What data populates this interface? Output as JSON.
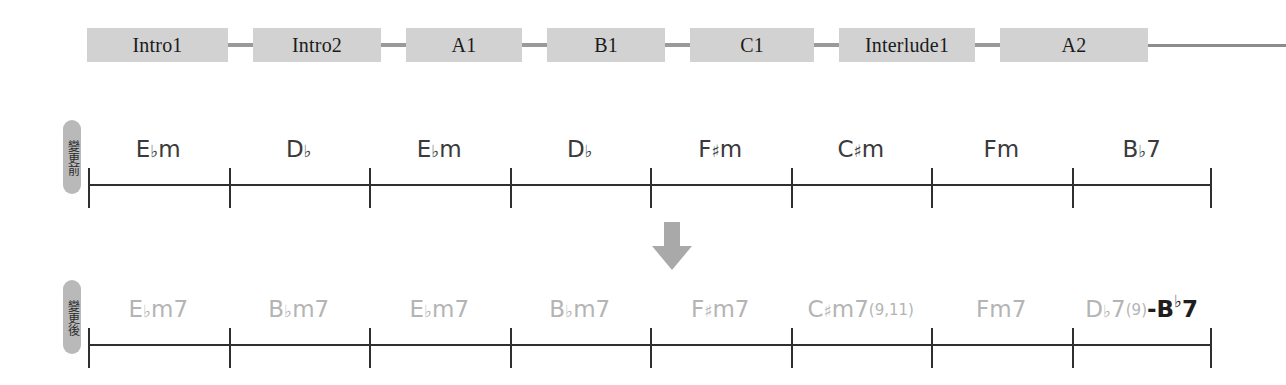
{
  "form_row": {
    "name": "song-form-timeline",
    "blocks": [
      {
        "label": "Intro1",
        "width": 141
      },
      {
        "label": "Intro2",
        "width": 128
      },
      {
        "label": "A1",
        "width": 116
      },
      {
        "label": "B1",
        "width": 118
      },
      {
        "label": "C1",
        "width": 124
      },
      {
        "label": "Interlude1",
        "width": 136
      },
      {
        "label": "A2",
        "width": 148
      }
    ],
    "connector_icon": "dash-connector-icon",
    "tail_icon": "timeline-continuation-line"
  },
  "staves": [
    {
      "id": "before",
      "tag_label": "變更前",
      "tag_meaning": "before-change",
      "cells": 8,
      "chords": [
        {
          "root": "E",
          "accidental": "♭",
          "quality": "m",
          "extension": "",
          "display": "E♭m"
        },
        {
          "root": "D",
          "accidental": "♭",
          "quality": "",
          "extension": "",
          "display": "D♭"
        },
        {
          "root": "E",
          "accidental": "♭",
          "quality": "m",
          "extension": "",
          "display": "E♭m"
        },
        {
          "root": "D",
          "accidental": "♭",
          "quality": "",
          "extension": "",
          "display": "D♭"
        },
        {
          "root": "F",
          "accidental": "♯",
          "quality": "m",
          "extension": "",
          "display": "F♯m"
        },
        {
          "root": "C",
          "accidental": "♯",
          "quality": "m",
          "extension": "",
          "display": "C♯m"
        },
        {
          "root": "F",
          "accidental": "",
          "quality": "m",
          "extension": "",
          "display": "Fm"
        },
        {
          "root": "B",
          "accidental": "♭",
          "quality": "7",
          "extension": "",
          "display": "B♭7"
        }
      ]
    },
    {
      "id": "after",
      "tag_label": "變更後",
      "tag_meaning": "after-change",
      "cells": 8,
      "chords": [
        {
          "root": "E",
          "accidental": "♭",
          "quality": "m7",
          "extension": "",
          "display": "E♭m7"
        },
        {
          "root": "B",
          "accidental": "♭",
          "quality": "m7",
          "extension": "",
          "display": "B♭m7"
        },
        {
          "root": "E",
          "accidental": "♭",
          "quality": "m7",
          "extension": "",
          "display": "E♭m7"
        },
        {
          "root": "B",
          "accidental": "♭",
          "quality": "m7",
          "extension": "",
          "display": "B♭m7"
        },
        {
          "root": "F",
          "accidental": "♯",
          "quality": "m7",
          "extension": "",
          "display": "F♯m7"
        },
        {
          "root": "C",
          "accidental": "♯",
          "quality": "m7",
          "extension": "(9,11)",
          "display": "C♯m7(9,11)"
        },
        {
          "root": "F",
          "accidental": "",
          "quality": "m7",
          "extension": "",
          "display": "Fm7"
        },
        {
          "root": "D",
          "accidental": "♭",
          "quality": "7",
          "extension": "(9)",
          "display": "D♭7(9)",
          "suffix": "-B♭7"
        }
      ]
    }
  ],
  "arrow": {
    "name": "transform-arrow",
    "direction": "down",
    "color": "#a9a9a9"
  },
  "colors": {
    "block_fill": "#d2d2d2",
    "connector": "#9a9a9a",
    "stave_line": "#2f2f2f",
    "chord_before": "#3a3a3a",
    "chord_after": "#b4b4b4",
    "chord_highlight": "#1e1e1e",
    "tag_fill": "#b9b9b9"
  }
}
